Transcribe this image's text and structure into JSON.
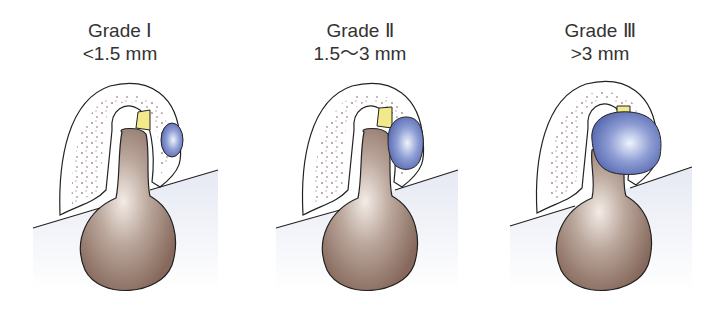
{
  "figure": {
    "panels": [
      {
        "grade": "Grade Ⅰ",
        "size": "<1.5 mm"
      },
      {
        "grade": "Grade Ⅱ",
        "size": "1.5～3 mm"
      },
      {
        "grade": "Grade Ⅲ",
        "size": ">3 mm"
      }
    ],
    "colors": {
      "bulb": "#9c8478",
      "bulb_highlight": "#f3ece6",
      "cyst": "#6f80c2",
      "cyst_highlight": "#e8f0fb",
      "stalk_tip": "#f2ea8a",
      "bone_dots": "#a08080",
      "soft_tissue": "#eef0f6",
      "outline": "#222222"
    }
  }
}
